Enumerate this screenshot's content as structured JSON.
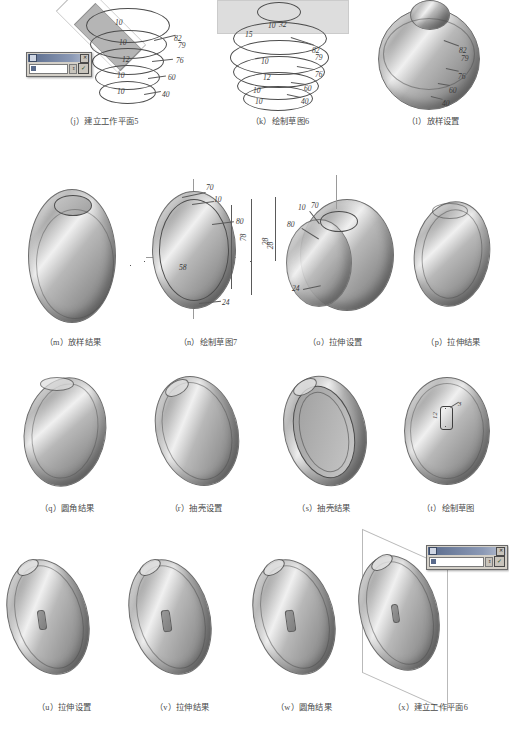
{
  "page": {
    "background_color": "#ffffff",
    "figure_count": 15
  },
  "figures": [
    {
      "id": "j",
      "caption": "（j）建立工作平面5",
      "type": "loft-profiles-with-workplane",
      "has_dialog": true,
      "dialog": {
        "title": "",
        "field_value": "",
        "ok_label": "✓",
        "close_label": "✕",
        "spinner_label": "⇕"
      },
      "dimensions_inner": [
        "10",
        "10",
        "12",
        "10",
        "10"
      ],
      "dimensions_outer": [
        "82",
        "79",
        "76",
        "60",
        "40"
      ]
    },
    {
      "id": "k",
      "caption": "（k）绘制草图6",
      "type": "loft-profiles-sketch",
      "has_dialog": false,
      "dimensions_inner": [
        "10",
        "32",
        "15",
        "10",
        "12",
        "10",
        "10"
      ],
      "dimensions_outer": [
        "82",
        "79",
        "76",
        "60",
        "40"
      ]
    },
    {
      "id": "l",
      "caption": "（l）放样设置",
      "type": "loft-preview-solid",
      "has_dialog": false,
      "dimensions_inner": [],
      "dimensions_outer": [
        "82",
        "79",
        "76",
        "60",
        "40"
      ]
    },
    {
      "id": "m",
      "caption": "（m）放样结果",
      "type": "loft-result-solid",
      "has_dialog": false,
      "dimensions_inner": [],
      "dimensions_outer": []
    },
    {
      "id": "n",
      "caption": "（n）绘制草图7",
      "type": "sketch-profile-2d",
      "has_dialog": false,
      "dimensions_inner": [
        "70",
        "10",
        "80",
        "78",
        "58",
        "24"
      ],
      "dimensions_outer": [
        "28"
      ]
    },
    {
      "id": "o",
      "caption": "（o）拉伸设置",
      "type": "extrude-preview",
      "has_dialog": false,
      "dimensions_inner": [
        "10",
        "70",
        "80",
        "24"
      ],
      "dimensions_outer": [
        "28"
      ]
    },
    {
      "id": "p",
      "caption": "（p）拉伸结果",
      "type": "extrude-result",
      "has_dialog": false,
      "dimensions_inner": [],
      "dimensions_outer": []
    },
    {
      "id": "q",
      "caption": "（q）圆角结果",
      "type": "fillet-result",
      "has_dialog": false,
      "dimensions_inner": [],
      "dimensions_outer": []
    },
    {
      "id": "r",
      "caption": "（r）抽壳设置",
      "type": "shell-setup",
      "has_dialog": false,
      "dimensions_inner": [],
      "dimensions_outer": []
    },
    {
      "id": "s",
      "caption": "（s）抽壳结果",
      "type": "shell-result",
      "has_dialog": false,
      "dimensions_inner": [],
      "dimensions_outer": []
    },
    {
      "id": "t",
      "caption": "（t）绘制草图",
      "type": "sketch-on-face",
      "has_dialog": false,
      "dimensions_inner": [
        "12",
        "3"
      ],
      "dimensions_outer": []
    },
    {
      "id": "u",
      "caption": "（u）拉伸设置",
      "type": "extrude-slot-setup",
      "has_dialog": false,
      "dimensions_inner": [],
      "dimensions_outer": []
    },
    {
      "id": "v",
      "caption": "（v）拉伸结果",
      "type": "extrude-slot-result",
      "has_dialog": false,
      "dimensions_inner": [],
      "dimensions_outer": []
    },
    {
      "id": "w",
      "caption": "（w）圆角结果",
      "type": "fillet-slot-result",
      "has_dialog": false,
      "dimensions_inner": [],
      "dimensions_outer": []
    },
    {
      "id": "x",
      "caption": "（x）建立工作平面6",
      "type": "workplane-on-disc",
      "has_dialog": true,
      "dialog": {
        "title": "",
        "field_value": "",
        "ok_label": "✓",
        "close_label": "✕",
        "spinner_label": "⇕"
      },
      "dimensions_inner": [],
      "dimensions_outer": []
    }
  ]
}
